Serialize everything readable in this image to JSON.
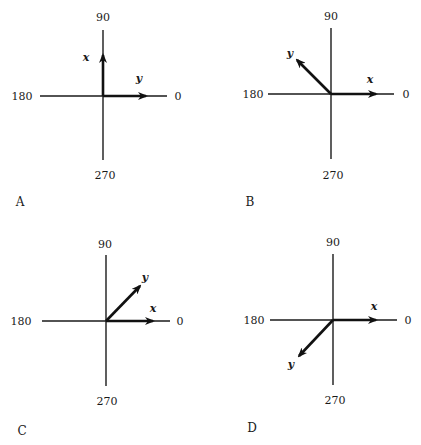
{
  "panels": [
    {
      "label": "A",
      "center": [
        103,
        96
      ],
      "v_axis": [
        30,
        160
      ],
      "h_axis": [
        40,
        167
      ],
      "angles": {
        "top": "90",
        "left": "180",
        "right": "0",
        "bottom": "270"
      },
      "angle_pos": {
        "top": [
          103,
          21
        ],
        "left": [
          22,
          100
        ],
        "right": [
          178,
          100
        ],
        "bottom": [
          105,
          179
        ]
      },
      "vectors": [
        {
          "name": "x",
          "tip": [
            103,
            55
          ],
          "label_pos": [
            86,
            61
          ]
        },
        {
          "name": "y",
          "tip": [
            146,
            96
          ],
          "label_pos": [
            139,
            82
          ]
        }
      ],
      "label_pos": [
        20,
        206
      ]
    },
    {
      "label": "B",
      "center": [
        331,
        94
      ],
      "v_axis": [
        28,
        159
      ],
      "h_axis": [
        268,
        394
      ],
      "angles": {
        "top": "90",
        "left": "180",
        "right": "0",
        "bottom": "270"
      },
      "angle_pos": {
        "top": [
          331,
          20
        ],
        "left": [
          253,
          98
        ],
        "right": [
          406,
          98
        ],
        "bottom": [
          333,
          179
        ]
      },
      "vectors": [
        {
          "name": "y",
          "tip": [
            297,
            60
          ],
          "label_pos": [
            290,
            57
          ]
        },
        {
          "name": "x",
          "tip": [
            376,
            94
          ],
          "label_pos": [
            370,
            83
          ]
        }
      ],
      "label_pos": [
        250,
        206
      ]
    },
    {
      "label": "C",
      "center": [
        106,
        321
      ],
      "v_axis": [
        255,
        386
      ],
      "h_axis": [
        42,
        170
      ],
      "angles": {
        "top": "90",
        "left": "180",
        "right": "0",
        "bottom": "270"
      },
      "angle_pos": {
        "top": [
          105,
          248
        ],
        "left": [
          21,
          325
        ],
        "right": [
          180,
          325
        ],
        "bottom": [
          107,
          405
        ]
      },
      "vectors": [
        {
          "name": "y",
          "tip": [
            140,
            286
          ],
          "label_pos": [
            145,
            281
          ]
        },
        {
          "name": "x",
          "tip": [
            153,
            321
          ],
          "label_pos": [
            153,
            312
          ]
        }
      ],
      "label_pos": [
        22,
        435
      ]
    },
    {
      "label": "D",
      "center": [
        333,
        320
      ],
      "v_axis": [
        254,
        385
      ],
      "h_axis": [
        270,
        397
      ],
      "angles": {
        "top": "90",
        "left": "180",
        "right": "0",
        "bottom": "270"
      },
      "angle_pos": {
        "top": [
          333,
          246
        ],
        "left": [
          254,
          324
        ],
        "right": [
          408,
          324
        ],
        "bottom": [
          335,
          404
        ]
      },
      "vectors": [
        {
          "name": "x",
          "tip": [
            376,
            320
          ],
          "label_pos": [
            374,
            310
          ]
        },
        {
          "name": "y",
          "tip": [
            299,
            356
          ],
          "label_pos": [
            291,
            368
          ]
        }
      ],
      "label_pos": [
        252,
        432
      ]
    }
  ]
}
